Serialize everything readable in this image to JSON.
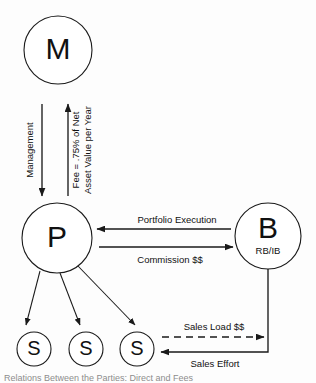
{
  "diagram": {
    "type": "relationship-flow-diagram",
    "background_color": "#fdfdfd",
    "stroke_color": "#1a1a1a",
    "nodes": [
      {
        "id": "M",
        "label": "M",
        "sublabel": "",
        "cx": 58,
        "cy": 50,
        "r": 34
      },
      {
        "id": "P",
        "label": "P",
        "sublabel": "",
        "cx": 57,
        "cy": 238,
        "r": 35
      },
      {
        "id": "B",
        "label": "B",
        "sublabel": "RB/IB",
        "cx": 268,
        "cy": 236,
        "r": 33
      },
      {
        "id": "S1",
        "label": "S",
        "sublabel": "",
        "cx": 34,
        "cy": 349,
        "r": 17
      },
      {
        "id": "S2",
        "label": "S",
        "sublabel": "",
        "cx": 86,
        "cy": 349,
        "r": 17
      },
      {
        "id": "S3",
        "label": "S",
        "sublabel": "",
        "cx": 137,
        "cy": 349,
        "r": 17
      }
    ],
    "edges": [
      {
        "id": "management",
        "label": "Management",
        "from": "M",
        "to": "P",
        "style": "solid",
        "direction": "down",
        "orientation": "vertical"
      },
      {
        "id": "fee",
        "label_line1": "Fee = .75% of Net",
        "label_line2": "Asset Value per Year",
        "from": "P",
        "to": "M",
        "style": "solid",
        "direction": "up",
        "orientation": "vertical"
      },
      {
        "id": "portfolio-execution",
        "label": "Portfolio Execution",
        "from": "B",
        "to": "P",
        "style": "solid",
        "direction": "left",
        "orientation": "horizontal"
      },
      {
        "id": "commission",
        "label": "Commission $$",
        "from": "P",
        "to": "B",
        "style": "solid",
        "direction": "right",
        "orientation": "horizontal"
      },
      {
        "id": "sales-load",
        "label": "Sales Load $$",
        "from": "S3",
        "to": "B",
        "style": "dashed",
        "direction": "right",
        "orientation": "horizontal"
      },
      {
        "id": "sales-effort",
        "label": "Sales Effort",
        "from": "B",
        "to": "S3",
        "style": "solid",
        "direction": "left",
        "orientation": "horizontal"
      },
      {
        "id": "p-to-s1",
        "label": "",
        "from": "P",
        "to": "S1",
        "style": "solid",
        "direction": "down",
        "orientation": "diagonal"
      },
      {
        "id": "p-to-s2",
        "label": "",
        "from": "P",
        "to": "S2",
        "style": "solid",
        "direction": "down",
        "orientation": "diagonal"
      },
      {
        "id": "p-to-s3",
        "label": "",
        "from": "P",
        "to": "S3",
        "style": "solid",
        "direction": "down",
        "orientation": "diagonal"
      }
    ],
    "caption": "Relations Between the Parties: Direct and Fees"
  }
}
